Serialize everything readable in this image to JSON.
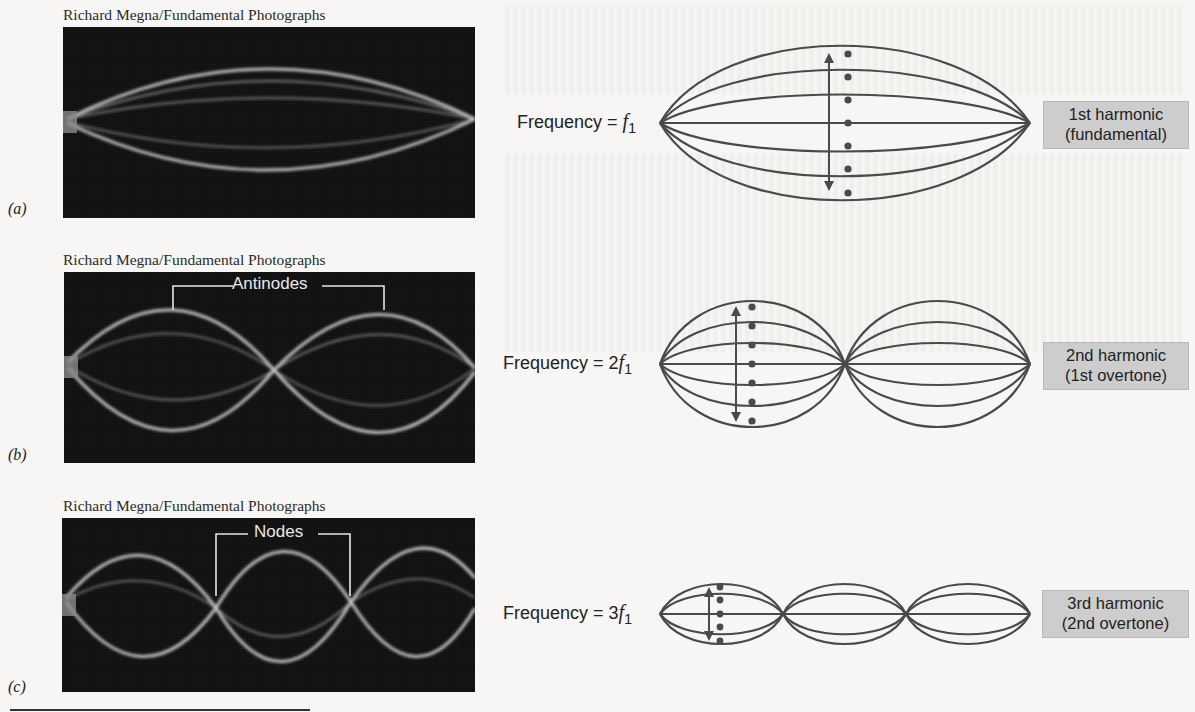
{
  "figure": {
    "panels": [
      {
        "letter": "(a)",
        "credit": "Richard Megna/Fundamental Photographs",
        "photo_annotation": null,
        "frequency_prefix": "Frequency = ",
        "frequency_multiplier": "",
        "frequency_symbol": "f",
        "frequency_subscript": "1",
        "harmonic_line1": "1st harmonic",
        "harmonic_line2": "(fundamental)",
        "loops": 1
      },
      {
        "letter": "(b)",
        "credit": "Richard Megna/Fundamental Photographs",
        "photo_annotation": "Antinodes",
        "frequency_prefix": "Frequency = ",
        "frequency_multiplier": "2",
        "frequency_symbol": "f",
        "frequency_subscript": "1",
        "harmonic_line1": "2nd harmonic",
        "harmonic_line2": "(1st overtone)",
        "loops": 2
      },
      {
        "letter": "(c)",
        "credit": "Richard Megna/Fundamental Photographs",
        "photo_annotation": "Nodes",
        "frequency_prefix": "Frequency = ",
        "frequency_multiplier": "3",
        "frequency_symbol": "f",
        "frequency_subscript": "1",
        "harmonic_line1": "3rd harmonic",
        "harmonic_line2": "(2nd overtone)",
        "loops": 3
      }
    ]
  },
  "colors": {
    "page_background": "#f7f6f4",
    "photo_background": "#121212",
    "string_glow": "#e8e8e8",
    "diagram_stroke": "#4a4a4a",
    "label_box": "#cdcdcd",
    "text": "#222222"
  }
}
